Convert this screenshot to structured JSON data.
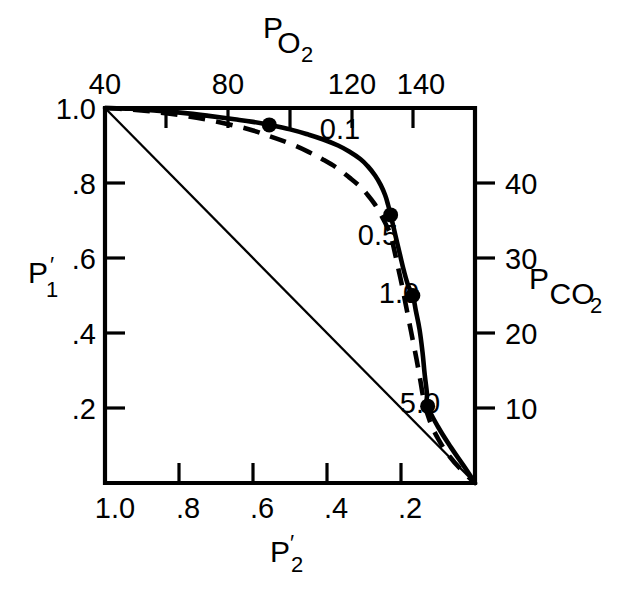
{
  "chart_data": {
    "type": "line",
    "title": "",
    "subtitle": "",
    "xlabel_bottom": "P'2",
    "xlabel_bottom_base": "P",
    "xlabel_bottom_prime": "′",
    "xlabel_bottom_sub": "2",
    "xlabel_top": "PO2",
    "xlabel_top_base": "P",
    "xlabel_top_sub": "O",
    "xlabel_top_sub2": "2",
    "ylabel_left": "P'1",
    "ylabel_left_base": "P",
    "ylabel_left_prime": "′",
    "ylabel_left_sub": "1",
    "ylabel_right": "PCO2",
    "ylabel_right_base": "P",
    "ylabel_right_sub": "CO",
    "ylabel_right_sub2": "2",
    "grid": false,
    "legend": "none",
    "axes": {
      "bottom": {
        "name": "P'2",
        "tick_labels": [
          "1.0",
          ".8",
          ".6",
          ".4",
          ".2"
        ],
        "tick_values": [
          1.0,
          0.8,
          0.6,
          0.4,
          0.2
        ],
        "range": [
          1.0,
          0.0
        ],
        "direction": "descending"
      },
      "left": {
        "name": "P'1",
        "tick_labels": [
          "1.0",
          ".8",
          ".6",
          ".4",
          ".2"
        ],
        "tick_values": [
          1.0,
          0.8,
          0.6,
          0.4,
          0.2
        ],
        "range": [
          1.0,
          0.0
        ],
        "direction": "descending"
      },
      "top": {
        "name": "PO2",
        "tick_labels": [
          "40",
          "80",
          "120",
          "140"
        ],
        "tick_values": [
          40,
          80,
          120,
          140
        ],
        "range": [
          40,
          160
        ],
        "minor_ticks": [
          60,
          100,
          160
        ]
      },
      "right": {
        "name": "PCO2",
        "tick_labels": [
          "40",
          "30",
          "20",
          "10"
        ],
        "tick_values": [
          40,
          30,
          20,
          10
        ],
        "range": [
          50,
          0
        ],
        "direction": "descending"
      }
    },
    "annotations": [
      {
        "label": "0.1",
        "x": 0.556,
        "y": 0.955
      },
      {
        "label": "0.5",
        "x": 0.228,
        "y": 0.715
      },
      {
        "label": "1.0",
        "x": 0.168,
        "y": 0.5
      },
      {
        "label": "5.0",
        "x": 0.128,
        "y": 0.205
      }
    ],
    "series": [
      {
        "name": "solid-curve",
        "style": "solid",
        "points": [
          [
            1.0,
            1.0
          ],
          [
            0.93,
            0.998
          ],
          [
            0.86,
            0.993
          ],
          [
            0.79,
            0.987
          ],
          [
            0.72,
            0.979
          ],
          [
            0.65,
            0.97
          ],
          [
            0.6,
            0.963
          ],
          [
            0.556,
            0.955
          ],
          [
            0.5,
            0.943
          ],
          [
            0.45,
            0.929
          ],
          [
            0.41,
            0.916
          ],
          [
            0.37,
            0.9
          ],
          [
            0.34,
            0.884
          ],
          [
            0.31,
            0.864
          ],
          [
            0.29,
            0.845
          ],
          [
            0.27,
            0.82
          ],
          [
            0.255,
            0.795
          ],
          [
            0.243,
            0.768
          ],
          [
            0.235,
            0.742
          ],
          [
            0.228,
            0.715
          ],
          [
            0.215,
            0.66
          ],
          [
            0.203,
            0.61
          ],
          [
            0.192,
            0.565
          ],
          [
            0.18,
            0.525
          ],
          [
            0.168,
            0.5
          ],
          [
            0.16,
            0.46
          ],
          [
            0.15,
            0.41
          ],
          [
            0.142,
            0.35
          ],
          [
            0.136,
            0.29
          ],
          [
            0.13,
            0.24
          ],
          [
            0.128,
            0.205
          ],
          [
            0.1,
            0.15
          ],
          [
            0.065,
            0.095
          ],
          [
            0.03,
            0.045
          ],
          [
            0.0,
            0.0
          ]
        ]
      },
      {
        "name": "dashed-curve",
        "style": "dashed",
        "points": [
          [
            1.0,
            1.0
          ],
          [
            0.93,
            0.996
          ],
          [
            0.86,
            0.989
          ],
          [
            0.79,
            0.98
          ],
          [
            0.72,
            0.968
          ],
          [
            0.65,
            0.953
          ],
          [
            0.6,
            0.94
          ],
          [
            0.556,
            0.925
          ],
          [
            0.5,
            0.905
          ],
          [
            0.45,
            0.883
          ],
          [
            0.41,
            0.862
          ],
          [
            0.37,
            0.838
          ],
          [
            0.34,
            0.815
          ],
          [
            0.31,
            0.79
          ],
          [
            0.29,
            0.768
          ],
          [
            0.272,
            0.745
          ],
          [
            0.258,
            0.722
          ],
          [
            0.246,
            0.7
          ],
          [
            0.236,
            0.68
          ],
          [
            0.228,
            0.662
          ],
          [
            0.218,
            0.62
          ],
          [
            0.208,
            0.575
          ],
          [
            0.198,
            0.53
          ],
          [
            0.188,
            0.48
          ],
          [
            0.178,
            0.43
          ],
          [
            0.168,
            0.38
          ],
          [
            0.158,
            0.33
          ],
          [
            0.148,
            0.275
          ],
          [
            0.138,
            0.22
          ],
          [
            0.122,
            0.165
          ],
          [
            0.098,
            0.115
          ],
          [
            0.068,
            0.07
          ],
          [
            0.032,
            0.03
          ],
          [
            0.0,
            0.0
          ]
        ]
      },
      {
        "name": "identity-line",
        "style": "thin-solid",
        "points": [
          [
            1.0,
            1.0
          ],
          [
            0.0,
            0.0
          ]
        ]
      }
    ],
    "markers": [
      {
        "label": "0.1",
        "x": 0.556,
        "y": 0.955
      },
      {
        "label": "0.5",
        "x": 0.228,
        "y": 0.715
      },
      {
        "label": "1.0",
        "x": 0.168,
        "y": 0.5
      },
      {
        "label": "5.0",
        "x": 0.128,
        "y": 0.205
      }
    ]
  },
  "labels": {
    "top_ticks": [
      "40",
      "80",
      "120",
      "140"
    ],
    "bottom_ticks": [
      "1.0",
      ".8",
      ".6",
      ".4",
      ".2"
    ],
    "left_ticks": [
      "1.0",
      ".8",
      ".6",
      ".4",
      ".2"
    ],
    "right_ticks": [
      "40",
      "30",
      "20",
      "10"
    ],
    "curve_labels": [
      "0.1",
      "0.5",
      "1.0",
      "5.0"
    ]
  },
  "colors": {
    "ink": "#000000",
    "background": "#ffffff"
  }
}
